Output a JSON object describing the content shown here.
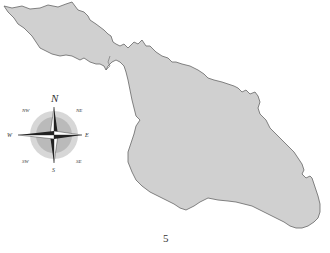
{
  "page": {
    "number": "5"
  },
  "map": {
    "land_color": "#d0d0d0",
    "outline_color": "#666666",
    "background": "#ffffff"
  },
  "compass": {
    "north": "N",
    "south": "S",
    "east": "E",
    "west": "W",
    "northeast": "NE",
    "northwest": "NW",
    "southeast": "SE",
    "southwest": "SW"
  }
}
